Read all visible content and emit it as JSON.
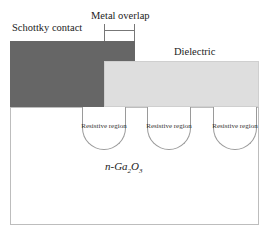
{
  "diagram": {
    "labels": {
      "schottky_contact": "Schottky contact",
      "metal_overlap": "Metal overlap",
      "dielectric": "Dielectric",
      "substrate_prefix": "n-Ga",
      "substrate_sub1": "2",
      "substrate_mid": "O",
      "substrate_sub2": "3"
    },
    "resistive_regions": [
      {
        "label": "Resistive region"
      },
      {
        "label": "Resistive region"
      },
      {
        "label": "Resistive region"
      }
    ],
    "colors": {
      "schottky": "#666666",
      "dielectric": "#dedede",
      "substrate": "#ffffff"
    }
  }
}
